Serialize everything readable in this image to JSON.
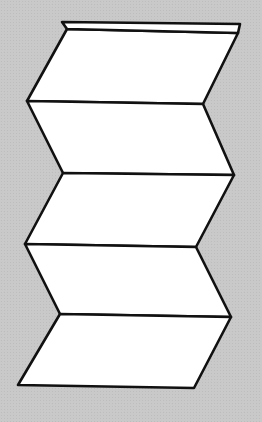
{
  "diagram": {
    "colors": {
      "background": "#c9c9c9",
      "panel_fill": "#ffffff",
      "stroke": "#111111"
    },
    "cap": {
      "points": [
        [
          62,
          22
        ],
        [
          240,
          24
        ],
        [
          238,
          33
        ],
        [
          67,
          29
        ]
      ]
    },
    "fold_vertices": {
      "left": [
        [
          67,
          29
        ],
        [
          27,
          101
        ],
        [
          63,
          173
        ],
        [
          25,
          244
        ],
        [
          60,
          314
        ],
        [
          18,
          385
        ]
      ],
      "right": [
        [
          238,
          33
        ],
        [
          203,
          104
        ],
        [
          234,
          175
        ],
        [
          196,
          247
        ],
        [
          231,
          317
        ],
        [
          194,
          388
        ]
      ]
    },
    "panel_count": 5
  }
}
